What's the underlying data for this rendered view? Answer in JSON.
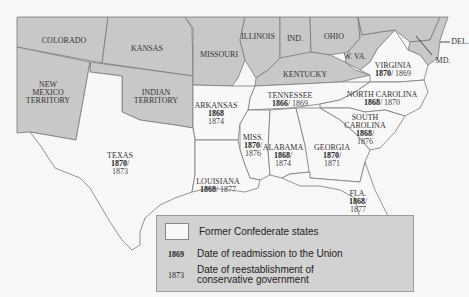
{
  "colors": {
    "union_states": "#c8c8c8",
    "confederate_states": "#f8f8f8",
    "border": "#7a7a7a",
    "legend_bg": "#d2d2d2"
  },
  "union_labels": [
    {
      "name": "COLORADO"
    },
    {
      "name": "KANSAS"
    },
    {
      "name": "MISSOURI"
    },
    {
      "name": "ILLINOIS"
    },
    {
      "name": "IND."
    },
    {
      "name": "OHIO"
    },
    {
      "name": "W. VA."
    },
    {
      "name": "KENTUCKY"
    },
    {
      "name": "DEL."
    },
    {
      "name": "MD."
    },
    {
      "name_line1": "NEW",
      "name_line2": "MEXICO",
      "name_line3": "TERRITORY"
    },
    {
      "name_line1": "INDIAN",
      "name_line2": "TERRITORY"
    }
  ],
  "confederate_states": [
    {
      "name": "VIRGINIA",
      "readmission": "1870",
      "conservative": "1869"
    },
    {
      "name": "TENNESSEE",
      "readmission": "1866",
      "conservative": "1869"
    },
    {
      "name": "NORTH CAROLINA",
      "readmission": "1868",
      "conservative": "1870"
    },
    {
      "name": "ARKANSAS",
      "readmission": "1868",
      "conservative": "1874"
    },
    {
      "name": "MISS.",
      "readmission": "1870",
      "conservative": "1876"
    },
    {
      "name": "ALABAMA",
      "readmission": "1868",
      "conservative": "1874"
    },
    {
      "name": "GEORGIA",
      "readmission": "1870",
      "conservative": "1871"
    },
    {
      "name_line1": "SOUTH",
      "name_line2": "CAROLINA",
      "readmission": "1868",
      "conservative": "1876"
    },
    {
      "name": "TEXAS",
      "readmission": "1870",
      "conservative": "1873"
    },
    {
      "name": "LOUISIANA",
      "readmission": "1868",
      "conservative": "1877"
    },
    {
      "name": "FLA.",
      "readmission": "1868",
      "conservative": "1877"
    }
  ],
  "legend": {
    "swatch_label": "Former Confederate states",
    "readmission_year": "1869",
    "readmission_label": "Date of readmission to the Union",
    "conservative_year": "1873",
    "conservative_label_line1": "Date of reestablishment of",
    "conservative_label_line2": "conservative government"
  }
}
